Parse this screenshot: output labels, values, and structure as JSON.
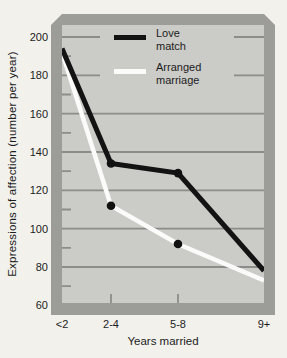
{
  "figure": {
    "background": "#f2f1ec",
    "frame_color": "#9c9c98",
    "plot_background": "#cbcbc7",
    "gridline_color": "#8c8c8a",
    "text_color": "#1c1c1c"
  },
  "legend": {
    "items": [
      {
        "label_line1": "Love",
        "label_line2": "match"
      },
      {
        "label_line1": "Arranged",
        "label_line2": "marriage"
      }
    ]
  },
  "chart_data": {
    "type": "line",
    "title": "",
    "xlabel": "Years married",
    "ylabel": "Expressions of affection (number per year)",
    "categories": [
      "<2",
      "2-4",
      "5-8",
      "9+"
    ],
    "series": [
      {
        "name": "Love match",
        "color": "#131313",
        "line_width": 5,
        "marker_color": "#111111",
        "marker_indices": [
          1,
          2
        ],
        "values": [
          194,
          134,
          129,
          78
        ]
      },
      {
        "name": "Arranged marriage",
        "color": "#fbfbfa",
        "line_width": 4.5,
        "marker_color": "#111111",
        "marker_indices": [
          1,
          2
        ],
        "values": [
          192,
          112,
          92,
          73
        ]
      }
    ],
    "ylim": [
      60,
      200
    ],
    "yticks_major": [
      200,
      180,
      160,
      140,
      120,
      100,
      80,
      60
    ],
    "yticks_minor": [
      190,
      170,
      150,
      130,
      110,
      90,
      70
    ],
    "grid": "horizontal-major",
    "legend_position": "top-inside"
  }
}
